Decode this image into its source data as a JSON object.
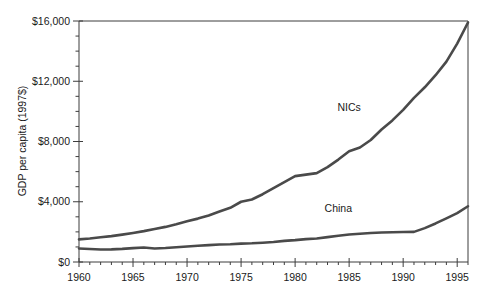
{
  "chart_data": {
    "type": "line",
    "title": "",
    "xlabel": "",
    "ylabel": "GDP per capita (1997$)",
    "xlim": [
      1960,
      1996
    ],
    "ylim": [
      0,
      16000
    ],
    "grid": false,
    "legend_position": "inline-annotation",
    "y_ticks": [
      0,
      4000,
      8000,
      12000,
      16000
    ],
    "y_tick_labels": [
      "$0",
      "$4,000",
      "$8,000",
      "$12,000",
      "$16,000"
    ],
    "y_minor_tick_step": 1000,
    "x_ticks": [
      1960,
      1965,
      1970,
      1975,
      1980,
      1985,
      1990,
      1995
    ],
    "x_tick_labels": [
      "1960",
      "1965",
      "1970",
      "1975",
      "1980",
      "1985",
      "1990",
      "1995"
    ],
    "x_minor_tick_step": 1,
    "x": [
      1960,
      1961,
      1962,
      1963,
      1964,
      1965,
      1966,
      1967,
      1968,
      1969,
      1970,
      1971,
      1972,
      1973,
      1974,
      1975,
      1976,
      1977,
      1978,
      1979,
      1980,
      1981,
      1982,
      1983,
      1984,
      1985,
      1986,
      1987,
      1988,
      1989,
      1990,
      1991,
      1992,
      1993,
      1994,
      1995,
      1996
    ],
    "series": [
      {
        "name": "NICs",
        "color": "#4a4a4a",
        "label_x": 1985,
        "label_y": 10000,
        "values": [
          1500,
          1560,
          1640,
          1720,
          1820,
          1930,
          2050,
          2190,
          2330,
          2500,
          2700,
          2880,
          3090,
          3350,
          3600,
          4000,
          4150,
          4500,
          4900,
          5300,
          5700,
          5800,
          5900,
          6300,
          6800,
          7350,
          7600,
          8100,
          8800,
          9400,
          10100,
          10900,
          11600,
          12400,
          13300,
          14500,
          15900
        ]
      },
      {
        "name": "China",
        "color": "#4a4a4a",
        "label_x": 1984,
        "label_y": 3300,
        "values": [
          900,
          860,
          830,
          840,
          870,
          920,
          960,
          900,
          930,
          980,
          1030,
          1080,
          1120,
          1160,
          1180,
          1220,
          1240,
          1280,
          1330,
          1400,
          1450,
          1520,
          1560,
          1650,
          1740,
          1830,
          1880,
          1930,
          1960,
          1980,
          1990,
          2000,
          2250,
          2560,
          2900,
          3250,
          3700
        ]
      }
    ]
  },
  "annotations": {
    "nics_label": "NICs",
    "china_label": "China"
  }
}
